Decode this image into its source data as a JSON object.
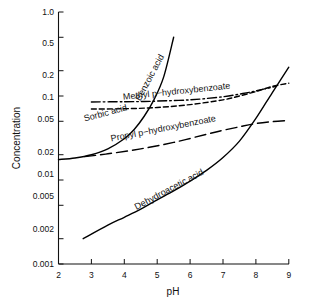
{
  "chart_data": {
    "type": "line",
    "title": "",
    "xlabel": "pH",
    "ylabel": "Concentration",
    "xlim": [
      2,
      9
    ],
    "ylim": [
      0.001,
      1.0
    ],
    "yscale": "log",
    "xscale": "linear",
    "grid": false,
    "legend": "inline-labels",
    "xticks": [
      "2",
      "3",
      "4",
      "5",
      "6",
      "7",
      "8",
      "9"
    ],
    "xtick_values": [
      2,
      3,
      4,
      5,
      6,
      7,
      8,
      9
    ],
    "yticks": [
      "1.0",
      "0.5",
      "0.2",
      "0.1",
      "0.05",
      "0.02",
      "0.01",
      "0.005",
      "0.002",
      "0.001"
    ],
    "ytick_values": [
      1.0,
      0.5,
      0.2,
      0.1,
      0.05,
      0.02,
      0.01,
      0.005,
      0.002,
      0.001
    ],
    "series": [
      {
        "name": "Benzoic acid",
        "style": "solid",
        "x": [
          2.0,
          2.5,
          3.0,
          3.5,
          4.0,
          4.3,
          4.6,
          4.9,
          5.2,
          5.5
        ],
        "values": [
          0.0175,
          0.0183,
          0.02,
          0.0235,
          0.031,
          0.04,
          0.057,
          0.09,
          0.17,
          0.5
        ]
      },
      {
        "name": "Methyl p−hydroxybenzoate",
        "style": "dashed",
        "x": [
          3.0,
          4.0,
          5.0,
          6.0,
          7.0,
          7.5,
          8.0,
          8.5,
          9.0
        ],
        "values": [
          0.07,
          0.0705,
          0.073,
          0.079,
          0.09,
          0.1,
          0.113,
          0.13,
          0.142
        ]
      },
      {
        "name": "Sorbic acid",
        "style": "dash-dot",
        "x": [
          3.0,
          4.0,
          4.6,
          5.0,
          6.0,
          7.0,
          7.6,
          8.0,
          8.6
        ],
        "values": [
          0.085,
          0.0855,
          0.086,
          0.087,
          0.09,
          0.098,
          0.107,
          0.115,
          0.13
        ]
      },
      {
        "name": "Propyl p−hydroxybenzoate",
        "style": "long-dash",
        "x": [
          2.8,
          3.5,
          4.5,
          5.5,
          6.5,
          7.0,
          7.5,
          8.0,
          8.5,
          9.0
        ],
        "values": [
          0.019,
          0.0205,
          0.0235,
          0.028,
          0.035,
          0.039,
          0.043,
          0.047,
          0.0495,
          0.051
        ]
      },
      {
        "name": "Dehydroacetic acid",
        "style": "solid",
        "x": [
          2.75,
          3.5,
          4.0,
          4.5,
          5.0,
          5.5,
          6.0,
          6.5,
          7.0,
          7.5,
          8.0,
          8.5,
          9.0
        ],
        "values": [
          0.002,
          0.0029,
          0.0036,
          0.0045,
          0.0058,
          0.0074,
          0.0097,
          0.013,
          0.0185,
          0.029,
          0.054,
          0.11,
          0.22
        ]
      }
    ],
    "annotations": [
      {
        "text": "Benzoic acid",
        "x": 4.85,
        "y": 0.16,
        "rotation": -62
      },
      {
        "text": "Methyl p−hydroxybenzoate",
        "x": 5.6,
        "y": 0.105,
        "rotation": -6
      },
      {
        "text": "Sorbic acid",
        "x": 3.45,
        "y": 0.058,
        "rotation": -15
      },
      {
        "text": "Propyl p−hydroxybenzoate",
        "x": 5.2,
        "y": 0.038,
        "rotation": -11
      },
      {
        "text": "Dehydroacetic acid",
        "x": 5.4,
        "y": 0.0072,
        "rotation": -28
      }
    ],
    "colors": {
      "axis": "#111111",
      "curve": "#000000",
      "background": "#ffffff"
    }
  },
  "axes": {
    "x_title": "pH",
    "y_title": "Concentration"
  },
  "tick_labels": {
    "y": {
      "t0": "1.0",
      "t1": "0.5",
      "t2": "0.2",
      "t3": "0.1",
      "t4": "0.05",
      "t5": "0.02",
      "t6": "0.01",
      "t7": "0.005",
      "t8": "0.002",
      "t9": "0.001"
    },
    "x": {
      "t0": "2",
      "t1": "3",
      "t2": "4",
      "t3": "5",
      "t4": "6",
      "t5": "7",
      "t6": "8",
      "t7": "9"
    }
  },
  "curve_labels": {
    "benzoic": "Benzoic acid",
    "methyl": "Methyl p−hydroxybenzoate",
    "sorbic": "Sorbic acid",
    "propyl": "Propyl p−hydroxybenzoate",
    "dehydroacetic": "Dehydroacetic acid"
  }
}
